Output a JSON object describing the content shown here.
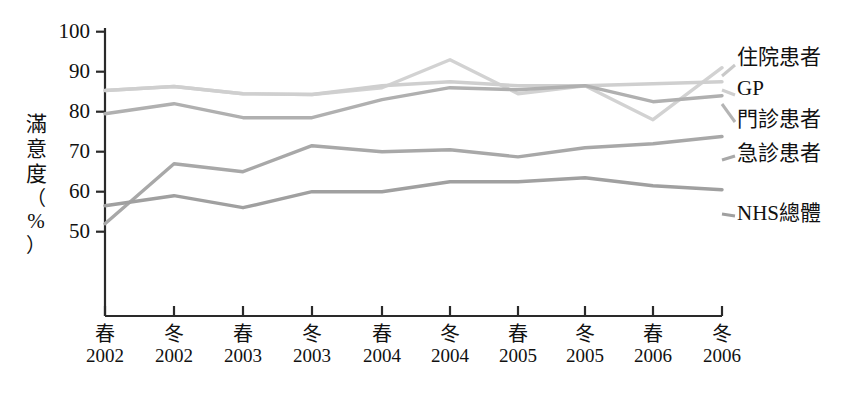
{
  "chart_data": {
    "type": "line",
    "title": "",
    "xlabel": "",
    "ylabel": "滿意度（%）",
    "ylim": [
      45,
      100
    ],
    "yticks": [
      50,
      60,
      70,
      80,
      90,
      100
    ],
    "ytick_labels": [
      "50",
      "60",
      "70",
      "80",
      "90",
      "100"
    ],
    "grid": false,
    "legend_position": "right",
    "categories": [
      "春 2002",
      "冬 2002",
      "春 2003",
      "冬 2003",
      "春 2004",
      "冬 2004",
      "春 2005",
      "冬 2005",
      "春 2006",
      "冬 2006"
    ],
    "x_seasons": [
      "春",
      "冬",
      "春",
      "冬",
      "春",
      "冬",
      "春",
      "冬",
      "春",
      "冬"
    ],
    "x_years": [
      "2002",
      "2002",
      "2003",
      "2003",
      "2004",
      "2004",
      "2005",
      "2005",
      "2006",
      "2006"
    ],
    "series": [
      {
        "name": "住院患者",
        "color": "#d2d2d2",
        "values": [
          85.3,
          86.3,
          84.5,
          84.3,
          86.0,
          93.0,
          84.5,
          86.5,
          78.0,
          91.0
        ]
      },
      {
        "name": "GP",
        "color": "#cfcfcf",
        "values": [
          85.3,
          86.3,
          84.5,
          84.3,
          86.5,
          87.5,
          86.5,
          86.5,
          87.0,
          87.5
        ]
      },
      {
        "name": "門診患者",
        "color": "#b0b0b0",
        "values": [
          79.5,
          82.0,
          78.5,
          78.5,
          83.0,
          86.0,
          85.5,
          86.5,
          82.5,
          84.0
        ]
      },
      {
        "name": "急診患者",
        "color": "#a8a8a8",
        "values": [
          52.0,
          67.0,
          65.0,
          71.5,
          70.0,
          70.5,
          68.7,
          71.0,
          72.0,
          73.8
        ]
      },
      {
        "name": "NHS總體",
        "color": "#a0a0a0",
        "values": [
          56.5,
          59.0,
          56.0,
          60.0,
          60.0,
          62.5,
          62.5,
          63.5,
          61.5,
          60.5
        ]
      }
    ],
    "top_pair_note": "住院患者 and GP overlap for 春2002–冬2003",
    "axis_color": "#2a2a2a"
  },
  "legend": {
    "items": [
      {
        "label": "住院患者"
      },
      {
        "label": "GP"
      },
      {
        "label": "門診患者"
      },
      {
        "label": "急診患者"
      },
      {
        "label": "NHS總體"
      }
    ]
  }
}
